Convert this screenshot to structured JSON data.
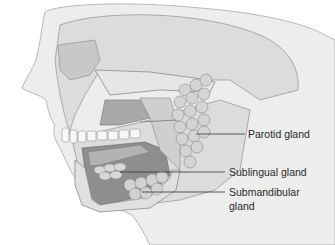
{
  "figure": {
    "labels": [
      {
        "text": "Parotid gland"
      },
      {
        "text": "Sublingual gland"
      },
      {
        "text": "Submandibular",
        "text2": "gland"
      }
    ]
  }
}
